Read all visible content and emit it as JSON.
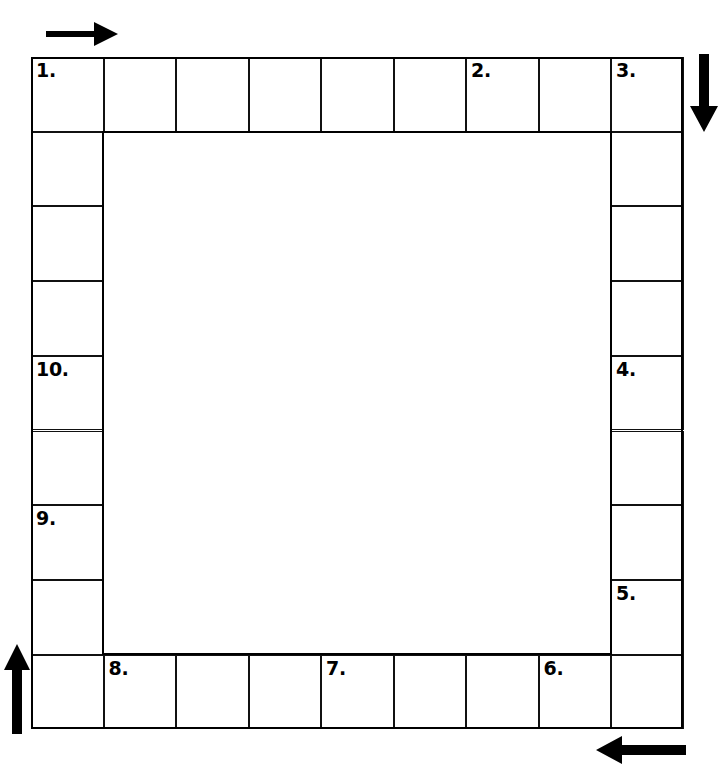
{
  "puzzle": {
    "type": "ring-crossword",
    "title": "",
    "grid": {
      "columns": 9,
      "rows": 9,
      "hollow_center": true,
      "cell_width": 72.5,
      "cell_height": 74.7,
      "origin_x": 31,
      "origin_y": 57,
      "line_color": "#000000",
      "cell_fill": "#ffffff"
    },
    "direction": "clockwise",
    "arrows": [
      {
        "name": "arrow-top",
        "glyph": "arrow-right-icon",
        "points": "right",
        "label": ""
      },
      {
        "name": "arrow-right",
        "glyph": "arrow-down-icon",
        "points": "down",
        "label": ""
      },
      {
        "name": "arrow-bottom",
        "glyph": "arrow-left-icon",
        "points": "left",
        "label": ""
      },
      {
        "name": "arrow-left",
        "glyph": "arrow-up-icon",
        "points": "up",
        "label": ""
      }
    ],
    "numbered_cells": [
      {
        "number": "1.",
        "row": 0,
        "col": 0,
        "letter": ""
      },
      {
        "number": "2.",
        "row": 0,
        "col": 6,
        "letter": ""
      },
      {
        "number": "3.",
        "row": 0,
        "col": 8,
        "letter": ""
      },
      {
        "number": "4.",
        "row": 4,
        "col": 8,
        "letter": ""
      },
      {
        "number": "5.",
        "row": 7,
        "col": 8,
        "letter": ""
      },
      {
        "number": "6.",
        "row": 8,
        "col": 7,
        "letter": ""
      },
      {
        "number": "7.",
        "row": 8,
        "col": 4,
        "letter": ""
      },
      {
        "number": "8.",
        "row": 8,
        "col": 1,
        "letter": ""
      },
      {
        "number": "9.",
        "row": 6,
        "col": 0,
        "letter": ""
      },
      {
        "number": "10.",
        "row": 4,
        "col": 0,
        "letter": ""
      }
    ],
    "cells": [
      {
        "row": 0,
        "col": 0,
        "number": "1.",
        "letter": ""
      },
      {
        "row": 0,
        "col": 1,
        "number": "",
        "letter": ""
      },
      {
        "row": 0,
        "col": 2,
        "number": "",
        "letter": ""
      },
      {
        "row": 0,
        "col": 3,
        "number": "",
        "letter": ""
      },
      {
        "row": 0,
        "col": 4,
        "number": "",
        "letter": ""
      },
      {
        "row": 0,
        "col": 5,
        "number": "",
        "letter": ""
      },
      {
        "row": 0,
        "col": 6,
        "number": "2.",
        "letter": ""
      },
      {
        "row": 0,
        "col": 7,
        "number": "",
        "letter": ""
      },
      {
        "row": 0,
        "col": 8,
        "number": "3.",
        "letter": ""
      },
      {
        "row": 1,
        "col": 0,
        "number": "",
        "letter": ""
      },
      {
        "row": 1,
        "col": 8,
        "number": "",
        "letter": ""
      },
      {
        "row": 2,
        "col": 0,
        "number": "",
        "letter": ""
      },
      {
        "row": 2,
        "col": 8,
        "number": "",
        "letter": ""
      },
      {
        "row": 3,
        "col": 0,
        "number": "",
        "letter": ""
      },
      {
        "row": 3,
        "col": 8,
        "number": "",
        "letter": ""
      },
      {
        "row": 4,
        "col": 0,
        "number": "10.",
        "letter": ""
      },
      {
        "row": 4,
        "col": 8,
        "number": "4.",
        "letter": ""
      },
      {
        "row": 5,
        "col": 0,
        "number": "",
        "letter": ""
      },
      {
        "row": 5,
        "col": 8,
        "number": "",
        "letter": ""
      },
      {
        "row": 6,
        "col": 0,
        "number": "9.",
        "letter": ""
      },
      {
        "row": 6,
        "col": 8,
        "number": "",
        "letter": ""
      },
      {
        "row": 7,
        "col": 0,
        "number": "",
        "letter": ""
      },
      {
        "row": 7,
        "col": 8,
        "number": "5.",
        "letter": ""
      },
      {
        "row": 8,
        "col": 0,
        "number": "",
        "letter": ""
      },
      {
        "row": 8,
        "col": 1,
        "number": "8.",
        "letter": ""
      },
      {
        "row": 8,
        "col": 2,
        "number": "",
        "letter": ""
      },
      {
        "row": 8,
        "col": 3,
        "number": "",
        "letter": ""
      },
      {
        "row": 8,
        "col": 4,
        "number": "7.",
        "letter": ""
      },
      {
        "row": 8,
        "col": 5,
        "number": "",
        "letter": ""
      },
      {
        "row": 8,
        "col": 6,
        "number": "",
        "letter": ""
      },
      {
        "row": 8,
        "col": 7,
        "number": "6.",
        "letter": ""
      },
      {
        "row": 8,
        "col": 8,
        "number": "",
        "letter": ""
      }
    ]
  }
}
